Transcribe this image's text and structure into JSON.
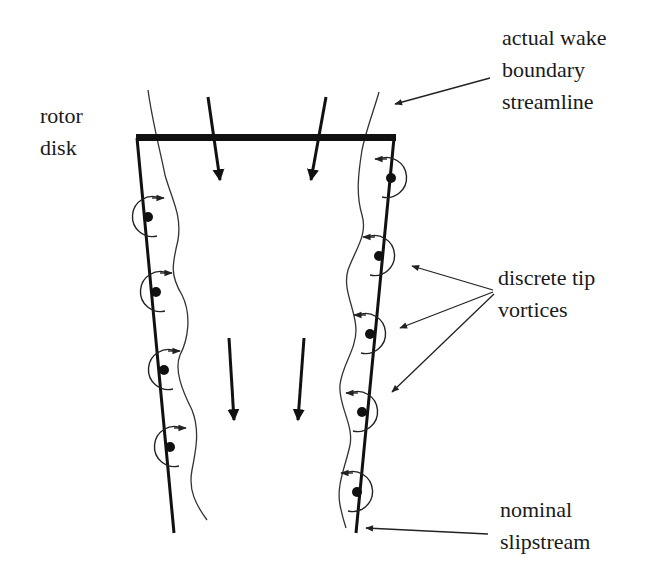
{
  "diagram": {
    "type": "rotor wake schematic",
    "colors": {
      "ink": "#111111",
      "thin_line": "#333333",
      "background": "#ffffff"
    },
    "labels": {
      "rotor_disk": [
        "rotor",
        "disk"
      ],
      "wake_boundary": [
        "actual wake",
        "boundary",
        "streamline"
      ],
      "tip_vortices": [
        "discrete tip",
        "vortices"
      ],
      "slipstream": [
        "nominal",
        "slipstream"
      ]
    },
    "elements": {
      "rotor_disk": {
        "x1": 136,
        "x2": 395,
        "y": 138
      },
      "left_slipstream": {
        "from": [
          136,
          138
        ],
        "to": [
          174,
          533
        ]
      },
      "right_slipstream": {
        "from": [
          395,
          138
        ],
        "to": [
          356,
          533
        ]
      },
      "left_vortices": [
        [
          148,
          217
        ],
        [
          156,
          292
        ],
        [
          164,
          370
        ],
        [
          170,
          447
        ]
      ],
      "right_vortices": [
        [
          391,
          178
        ],
        [
          379,
          256
        ],
        [
          370,
          334
        ],
        [
          362,
          412
        ],
        [
          357,
          492
        ]
      ],
      "flow_arrows": [
        {
          "from": [
            208,
            97
          ],
          "to": [
            220,
            180
          ]
        },
        {
          "from": [
            326,
            97
          ],
          "to": [
            311,
            180
          ]
        },
        {
          "from": [
            229,
            338
          ],
          "to": [
            234,
            420
          ]
        },
        {
          "from": [
            304,
            338
          ],
          "to": [
            298,
            420
          ]
        }
      ]
    }
  }
}
